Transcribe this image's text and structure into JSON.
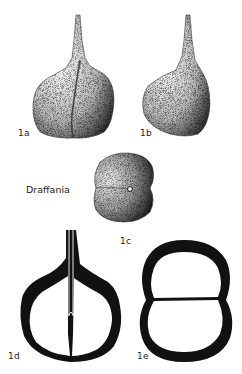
{
  "figure": {
    "genus_label": "Draffania",
    "panels": [
      {
        "id": "1a",
        "label": "1a",
        "view": "flask-shaped test, stippled, with medial suture"
      },
      {
        "id": "1b",
        "label": "1b",
        "view": "flask-shaped test, side view, stippled"
      },
      {
        "id": "1c",
        "label": "1c",
        "view": "apertural/end view, bilobed, stippled"
      },
      {
        "id": "1d",
        "label": "1d",
        "view": "longitudinal section, black wall, tubular neck"
      },
      {
        "id": "1e",
        "label": "1e",
        "view": "transverse section, two chambers, black wall"
      }
    ],
    "colors": {
      "ink": "#111111",
      "background": "#ffffff",
      "label": "#222222"
    }
  }
}
